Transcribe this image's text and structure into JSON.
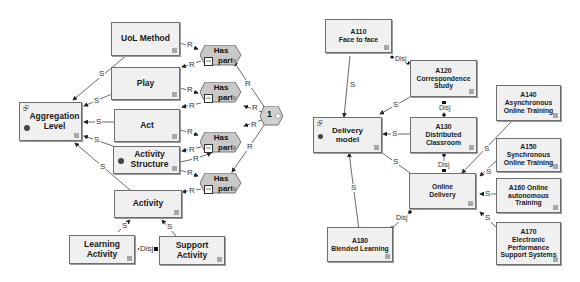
{
  "left_diagram": {
    "nodes": {
      "aggregation_level": "Aggregation\nLevel",
      "uol_method": "UoL Method",
      "play": "Play",
      "act": "Act",
      "activity_structure": "Activity\nStructure",
      "activity": "Activity",
      "learning_activity": "Learning\nActivity",
      "support_activity": "Support\nActivity"
    },
    "has_part": [
      {
        "line1": "Has",
        "line2": "part"
      },
      {
        "line1": "Has",
        "line2": "part"
      },
      {
        "line1": "Has",
        "line2": "part"
      },
      {
        "line1": "Has",
        "line2": "part"
      }
    ],
    "cardinality": "1",
    "labels": {
      "s": "S",
      "r": "R",
      "disj": "Disj"
    }
  },
  "right_diagram": {
    "nodes": {
      "delivery_model": "Delivery\nmodel",
      "a110": "A110\nFace to face",
      "a120": "A120\nCorrespondence\nStudy",
      "a130": "A130\nDistributed\nClassroom",
      "online_delivery": "Online\nDelivery",
      "a140": "A140\nAsynchronous\nOnline Training",
      "a150": "A150\nSynchronous\nOnline Training",
      "a160": "A160 Online\nautonomous\nTraining",
      "a170": "A170\nElectronic\nPerformance\nSupport Systems",
      "a180": "A180\nBlended Learning"
    },
    "labels": {
      "s": "S",
      "disj": "Disj"
    }
  },
  "colors": {
    "box_fill": "#f0f0f0",
    "box_border": "#6e6e6e",
    "hex_fill": "#c8c8c8",
    "line": "#444444"
  }
}
